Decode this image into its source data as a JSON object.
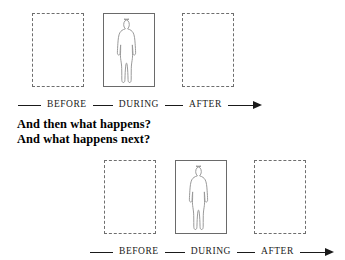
{
  "diagram": {
    "caption": {
      "line1": "And then what happens?",
      "line2": "And what happens next?"
    },
    "axis_labels": {
      "before": "BEFORE",
      "during": "DURING",
      "after": "AFTER"
    },
    "arrow_icon": "right-arrow-icon",
    "figure_icon": "standing-person-icon",
    "rows": [
      {
        "name": "top-timeline",
        "frames": [
          {
            "slot": "before",
            "state": "empty",
            "has_figure": false
          },
          {
            "slot": "during",
            "state": "filled",
            "has_figure": true
          },
          {
            "slot": "after",
            "state": "empty",
            "has_figure": false
          }
        ]
      },
      {
        "name": "bottom-timeline",
        "frames": [
          {
            "slot": "before",
            "state": "empty",
            "has_figure": false
          },
          {
            "slot": "during",
            "state": "filled",
            "has_figure": true
          },
          {
            "slot": "after",
            "state": "empty",
            "has_figure": false
          }
        ]
      }
    ],
    "colors": {
      "background": "#ffffff",
      "ink": "#1a1a1a",
      "dashed_border": "#6e6e6e",
      "solid_border": "#6a6a6a",
      "figure_stroke": "#9a9a9a"
    }
  }
}
